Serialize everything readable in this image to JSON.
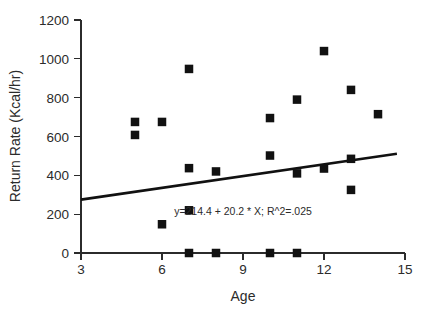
{
  "chart_data": {
    "type": "scatter",
    "title": "",
    "xlabel": "Age",
    "ylabel": "Return Rate (Kcal/hr)",
    "xlim": [
      3,
      15
    ],
    "ylim": [
      0,
      1200
    ],
    "xticks": [
      3,
      6,
      9,
      12,
      15
    ],
    "yticks": [
      0,
      200,
      400,
      600,
      800,
      1000,
      1200
    ],
    "xtick_labels": [
      "3",
      "6",
      "9",
      "12",
      "15"
    ],
    "ytick_labels": [
      "0",
      "200",
      "400",
      "600",
      "800",
      "1000",
      "1200"
    ],
    "grid": false,
    "legend": false,
    "marker": "filled-square",
    "marker_color": "#111111",
    "points": [
      {
        "x": 5.0,
        "y": 675
      },
      {
        "x": 5.0,
        "y": 608
      },
      {
        "x": 6.0,
        "y": 675
      },
      {
        "x": 6.0,
        "y": 148
      },
      {
        "x": 7.0,
        "y": 948
      },
      {
        "x": 7.0,
        "y": 437
      },
      {
        "x": 7.0,
        "y": 220
      },
      {
        "x": 7.0,
        "y": 0
      },
      {
        "x": 8.0,
        "y": 420
      },
      {
        "x": 8.0,
        "y": 0
      },
      {
        "x": 10.0,
        "y": 695
      },
      {
        "x": 10.0,
        "y": 502
      },
      {
        "x": 10.0,
        "y": 0
      },
      {
        "x": 11.0,
        "y": 790
      },
      {
        "x": 11.0,
        "y": 410
      },
      {
        "x": 11.0,
        "y": 0
      },
      {
        "x": 12.0,
        "y": 1040
      },
      {
        "x": 12.0,
        "y": 435
      },
      {
        "x": 13.0,
        "y": 840
      },
      {
        "x": 13.0,
        "y": 485
      },
      {
        "x": 13.0,
        "y": 325
      },
      {
        "x": 14.0,
        "y": 715
      }
    ],
    "fit_line": {
      "label": "y=214.4 + 20.2 * X; R^2=.025",
      "intercept": 214.4,
      "slope": 20.2,
      "r_squared": 0.025,
      "x_start": 3.0,
      "x_end": 14.7,
      "color": "#111111"
    },
    "annotation": {
      "text": "y=214.4 + 20.2 * X; R^2=.025",
      "x": 9.0,
      "y": 215
    }
  }
}
